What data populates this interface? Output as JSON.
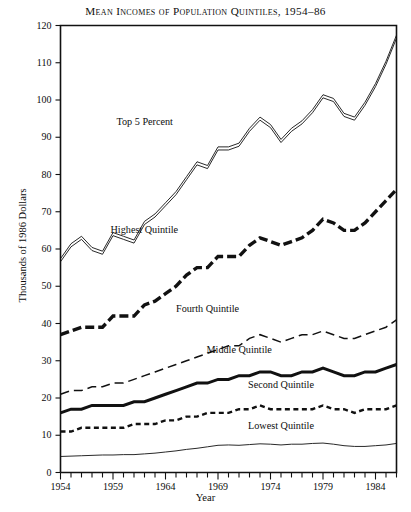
{
  "chart_data": {
    "type": "line",
    "title": "Mean Incomes of Population Quintiles, 1954–86",
    "xlabel": "Year",
    "ylabel": "Thousands of 1986 Dollars",
    "xlim": [
      1954,
      1986
    ],
    "ylim": [
      0,
      120
    ],
    "ytick_values": [
      0,
      10,
      20,
      30,
      40,
      50,
      60,
      70,
      80,
      90,
      100,
      110,
      120
    ],
    "xtick_labels": [
      "1954",
      "1959",
      "1964",
      "1969",
      "1974",
      "1979",
      "1984"
    ],
    "xtick_values": [
      1954,
      1959,
      1964,
      1969,
      1974,
      1979,
      1984
    ],
    "minor_xticks": "every year 1954-1986",
    "grid": false,
    "legend": "inline labels on plot",
    "x": [
      1954,
      1955,
      1956,
      1957,
      1958,
      1959,
      1960,
      1961,
      1962,
      1963,
      1964,
      1965,
      1966,
      1967,
      1968,
      1969,
      1970,
      1971,
      1972,
      1973,
      1974,
      1975,
      1976,
      1977,
      1978,
      1979,
      1980,
      1981,
      1982,
      1983,
      1984,
      1985,
      1986
    ],
    "series": [
      {
        "name": "Top 5 Percent",
        "style": "double-thin-line",
        "label_x": 1962,
        "label_y": 94,
        "values": [
          57,
          61,
          63,
          60,
          59,
          64,
          63,
          62,
          67,
          69,
          72,
          75,
          79,
          83,
          82,
          87,
          87,
          88,
          92,
          95,
          93,
          89,
          92,
          94,
          97,
          101,
          100,
          96,
          95,
          99,
          104,
          110,
          117
        ]
      },
      {
        "name": "Highest Quintile",
        "style": "thick-dashed",
        "label_x": 1962,
        "label_y": 65,
        "values": [
          37,
          38,
          39,
          39,
          39,
          42,
          42,
          42,
          45,
          46,
          48,
          50,
          53,
          55,
          55,
          58,
          58,
          58,
          61,
          63,
          62,
          61,
          62,
          63,
          65,
          68,
          67,
          65,
          65,
          67,
          70,
          73,
          76
        ]
      },
      {
        "name": "Fourth Quintile",
        "style": "thin-dashed",
        "label_x": 1968,
        "label_y": 44,
        "values": [
          21,
          22,
          22,
          23,
          23,
          24,
          24,
          25,
          26,
          27,
          28,
          29,
          30,
          31,
          32,
          33,
          34,
          34,
          36,
          37,
          36,
          35,
          36,
          37,
          37,
          38,
          37,
          36,
          36,
          37,
          38,
          39,
          41
        ]
      },
      {
        "name": "Middle Quintile",
        "style": "thick-solid",
        "label_x": 1971,
        "label_y": 33,
        "values": [
          16,
          17,
          17,
          18,
          18,
          18,
          18,
          19,
          19,
          20,
          21,
          22,
          23,
          24,
          24,
          25,
          25,
          26,
          26,
          27,
          27,
          26,
          26,
          27,
          27,
          28,
          27,
          26,
          26,
          27,
          27,
          28,
          29
        ]
      },
      {
        "name": "Second Quintile",
        "style": "short-dashed",
        "label_x": 1975,
        "label_y": 23.5,
        "values": [
          11,
          11,
          12,
          12,
          12,
          12,
          12,
          13,
          13,
          13,
          14,
          14,
          15,
          15,
          16,
          16,
          16,
          17,
          17,
          18,
          17,
          17,
          17,
          17,
          17,
          18,
          17,
          17,
          16,
          17,
          17,
          17,
          18
        ]
      },
      {
        "name": "Lowest Quintile",
        "style": "thin-solid",
        "label_x": 1975,
        "label_y": 12.5,
        "values": [
          4.3,
          4.4,
          4.5,
          4.6,
          4.7,
          4.7,
          4.8,
          4.8,
          5.0,
          5.2,
          5.5,
          5.8,
          6.2,
          6.5,
          6.9,
          7.3,
          7.4,
          7.3,
          7.5,
          7.7,
          7.6,
          7.4,
          7.6,
          7.6,
          7.8,
          7.9,
          7.6,
          7.2,
          7.0,
          7.0,
          7.2,
          7.4,
          7.8
        ]
      }
    ]
  },
  "axis": {
    "y_ticks": [
      "0",
      "10",
      "20",
      "30",
      "40",
      "50",
      "60",
      "70",
      "80",
      "90",
      "100",
      "110",
      "120"
    ],
    "x_ticks": [
      "1954",
      "1959",
      "1964",
      "1969",
      "1974",
      "1979",
      "1984"
    ]
  },
  "colors": {
    "ink": "#111111",
    "background": "#ffffff"
  }
}
